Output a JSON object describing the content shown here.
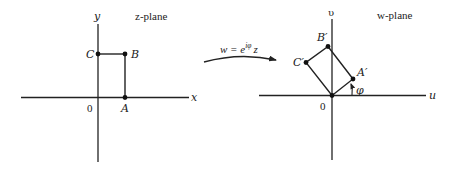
{
  "figure": {
    "z_plane": {
      "title": "z-plane",
      "x_axis_label": "x",
      "y_axis_label": "y",
      "origin_label": "0",
      "points": [
        {
          "name": "A",
          "label": "A"
        },
        {
          "name": "B",
          "label": "B"
        },
        {
          "name": "C",
          "label": "C"
        }
      ]
    },
    "mapping": {
      "lhs": "w = e",
      "exponent": "iφ",
      "rhs": "z"
    },
    "w_plane": {
      "title": "w-plane",
      "u_axis_label": "u",
      "v_axis_label": "υ",
      "origin_label": "0",
      "angle_label": "φ",
      "points": [
        {
          "name": "A'",
          "label": "A′"
        },
        {
          "name": "B'",
          "label": "B′"
        },
        {
          "name": "C'",
          "label": "C′"
        }
      ]
    }
  }
}
